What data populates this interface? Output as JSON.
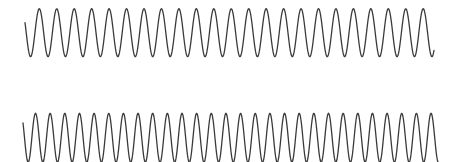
{
  "figure": {
    "width": 456,
    "height": 162,
    "background": "#ffffff",
    "line_color": "#3a3a3a",
    "line_width": 1.3
  },
  "chart_data": [
    {
      "type": "line",
      "title": "",
      "xlabel": "",
      "ylabel": "",
      "grid": false,
      "legend": null,
      "series": [
        {
          "name": "top-wave",
          "shape": "sine",
          "x_start_px": 25,
          "x_end_px": 434,
          "center_y_px": 32.7,
          "amplitude_px": 24,
          "period_px": 17.45,
          "first_peak_x_px": 39.3,
          "peak_count": 23,
          "peak_y_px": 8.7,
          "trough_y_px": 56.7
        }
      ]
    },
    {
      "type": "line",
      "title": "",
      "xlabel": "",
      "ylabel": "",
      "grid": false,
      "legend": null,
      "series": [
        {
          "name": "bottom-wave",
          "shape": "sine",
          "x_start_px": 23,
          "x_end_px": 438,
          "center_y_px": 137.8,
          "amplitude_px": 24.5,
          "period_px": 14.65,
          "first_peak_x_px": 35.5,
          "peak_count": 28,
          "peak_y_px": 113.3,
          "trough_y_px": 162.3
        }
      ]
    }
  ]
}
